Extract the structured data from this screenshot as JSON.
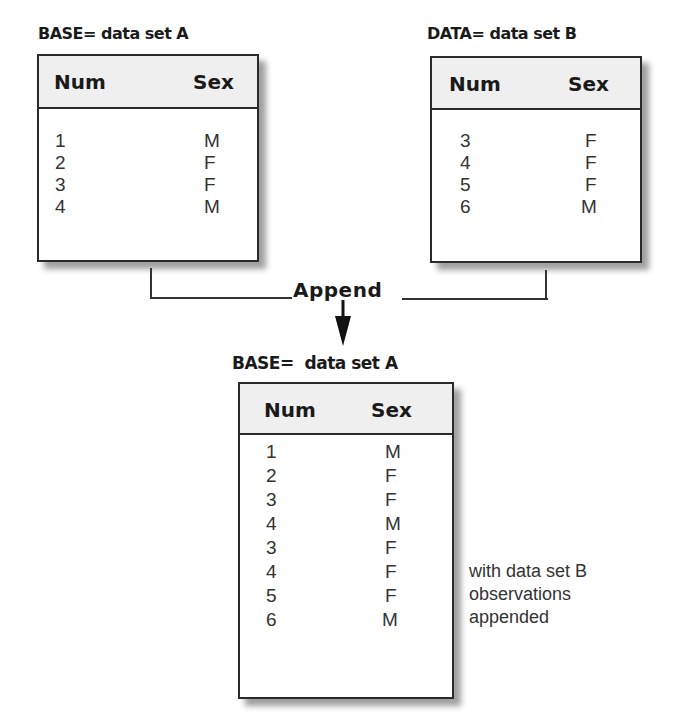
{
  "diagram": {
    "operation_label": "Append",
    "base_input": {
      "label": "BASE= data set A",
      "columns": [
        "Num",
        "Sex"
      ],
      "rows": [
        {
          "num": "1",
          "sex": "M"
        },
        {
          "num": "2",
          "sex": "F"
        },
        {
          "num": "3",
          "sex": "F"
        },
        {
          "num": "4",
          "sex": "M"
        }
      ]
    },
    "data_input": {
      "label": "DATA= data set B",
      "columns": [
        "Num",
        "Sex"
      ],
      "rows": [
        {
          "num": "3",
          "sex": "F"
        },
        {
          "num": "4",
          "sex": "F"
        },
        {
          "num": "5",
          "sex": "F"
        },
        {
          "num": "6",
          "sex": "M"
        }
      ]
    },
    "result": {
      "label": "BASE=  data set A",
      "columns": [
        "Num",
        "Sex"
      ],
      "rows": [
        {
          "num": "1",
          "sex": "M"
        },
        {
          "num": "2",
          "sex": "F"
        },
        {
          "num": "3",
          "sex": "F"
        },
        {
          "num": "4",
          "sex": "M"
        },
        {
          "num": "3",
          "sex": "F"
        },
        {
          "num": "4",
          "sex": "F"
        },
        {
          "num": "5",
          "sex": "F"
        },
        {
          "num": "6",
          "sex": "M"
        }
      ],
      "note_lines": [
        "with data set B",
        "observations",
        "appended"
      ]
    },
    "colors": {
      "header_bg": "#efefef",
      "border": "#2a2a2a",
      "text": "#333333"
    }
  }
}
